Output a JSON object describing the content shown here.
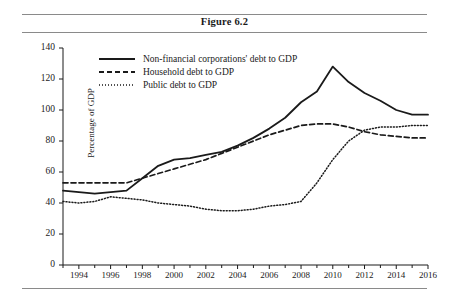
{
  "figure": {
    "title": "Figure 6.2"
  },
  "chart_data": {
    "type": "line",
    "title": "Figure 6.2",
    "xlabel": "",
    "ylabel": "Percentage of GDP",
    "ylim": [
      0,
      140
    ],
    "ytick_values": [
      0,
      20,
      40,
      60,
      80,
      100,
      120,
      140
    ],
    "xlim": [
      1993,
      2016
    ],
    "xtick_labels": [
      "1994",
      "1996",
      "1998",
      "2000",
      "2002",
      "2004",
      "2006",
      "2008",
      "2010",
      "2012",
      "2014",
      "2016"
    ],
    "xtick_values": [
      1994,
      1996,
      1998,
      2000,
      2002,
      2004,
      2006,
      2008,
      2010,
      2012,
      2014,
      2016
    ],
    "minor_ticks": [
      1993,
      1995,
      1997,
      1999,
      2001,
      2003,
      2005,
      2007,
      2009,
      2011,
      2013,
      2015
    ],
    "grid": false,
    "legend_position": "top-left",
    "x": [
      1993,
      1994,
      1995,
      1996,
      1997,
      1998,
      1999,
      2000,
      2001,
      2002,
      2003,
      2004,
      2005,
      2006,
      2007,
      2008,
      2009,
      2010,
      2011,
      2012,
      2013,
      2014,
      2015,
      2016
    ],
    "series": [
      {
        "name": "Non-financial corporations' debt to GDP",
        "style": "solid",
        "color": "#1a1a1a",
        "values": [
          48,
          47,
          46,
          47,
          48,
          56,
          64,
          68,
          69,
          71,
          73,
          77,
          82,
          88,
          95,
          105,
          112,
          128,
          118,
          111,
          106,
          100,
          97,
          97
        ]
      },
      {
        "name": "Household debt to GDP",
        "style": "dashed",
        "color": "#1a1a1a",
        "values": [
          53,
          53,
          53,
          53,
          53,
          56,
          59,
          62,
          65,
          68,
          72,
          76,
          80,
          84,
          87,
          90,
          91,
          91,
          89,
          86,
          84,
          83,
          82,
          82
        ]
      },
      {
        "name": "Public debt to GDP",
        "style": "dotted",
        "color": "#1a1a1a",
        "values": [
          41,
          40,
          41,
          44,
          43,
          42,
          40,
          39,
          38,
          36,
          35,
          35,
          36,
          38,
          39,
          41,
          53,
          68,
          80,
          87,
          89,
          89,
          90,
          90
        ]
      }
    ]
  }
}
